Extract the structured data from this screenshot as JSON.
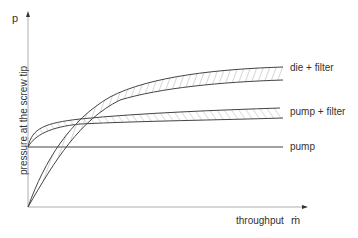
{
  "diagram": {
    "y_axis": {
      "symbol": "p",
      "label": "pressure at the screw tip"
    },
    "x_axis": {
      "label": "throughput",
      "symbol": "ṁ"
    },
    "curves": [
      {
        "name": "die-filter",
        "label": "die + filter"
      },
      {
        "name": "pump-filter",
        "label": "pump + filter"
      },
      {
        "name": "pump",
        "label": "pump"
      }
    ],
    "colors": {
      "line": "#444444",
      "axis": "#999999",
      "hatch": "#888888"
    }
  }
}
